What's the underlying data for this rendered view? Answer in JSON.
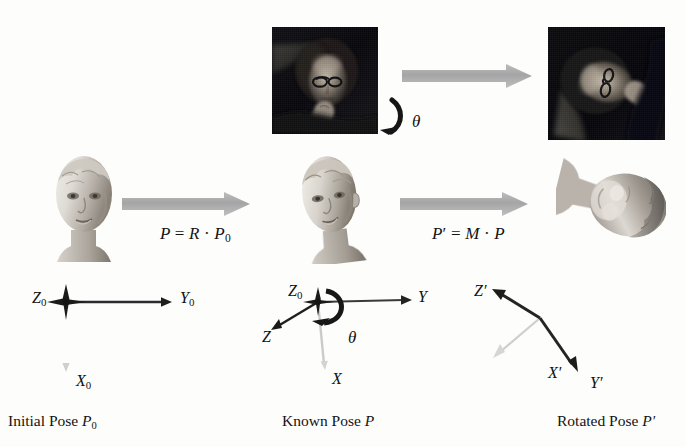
{
  "figure": {
    "background_color": "#fdfdfc",
    "arrow_color": "#a8a8a8",
    "axis_dark_color": "#2b2b2b",
    "axis_light_color": "#c4c4c4"
  },
  "top_row": {
    "source_photo": {
      "name": "frontal face photograph",
      "description": "dark photograph of a person wearing glasses with hand near chin"
    },
    "rotated_photo": {
      "name": "rotated face photograph",
      "description": "same photograph rotated by theta"
    },
    "rotation_symbol": "θ",
    "arrow_label": ""
  },
  "middle_row": {
    "heads": [
      {
        "name": "initial-head-model",
        "description": "frontal 3D head model render"
      },
      {
        "name": "known-head-model",
        "description": "3D head model render turned slightly"
      },
      {
        "name": "rotated-head-model",
        "description": "3D head model render rotated backward"
      }
    ],
    "equations": [
      {
        "id": "eq1",
        "lhs": "P",
        "rhs": "R · P₀",
        "full": "P = R · P0"
      },
      {
        "id": "eq2",
        "lhs": "P′",
        "rhs": "M · P",
        "full": "P' = M · P"
      }
    ]
  },
  "axes": {
    "initial": {
      "labels": {
        "z": "Z",
        "z_sub": "0",
        "y": "Y",
        "y_sub": "0",
        "x": "X",
        "x_sub": "0"
      },
      "caption": {
        "text": "Initial Pose ",
        "symbol": "P",
        "symbol_sub": "0"
      }
    },
    "known": {
      "labels": {
        "z0": "Z",
        "z0_sub": "0",
        "z": "Z",
        "y": "Y",
        "x": "X"
      },
      "theta": "θ",
      "caption": {
        "text": "Known Pose ",
        "symbol": "P",
        "symbol_sub": ""
      }
    },
    "rotated": {
      "labels": {
        "z": "Z′",
        "y": "Y′",
        "x": "X′"
      },
      "caption": {
        "text": "Rotated Pose ",
        "symbol": "P′",
        "symbol_sub": ""
      }
    }
  }
}
